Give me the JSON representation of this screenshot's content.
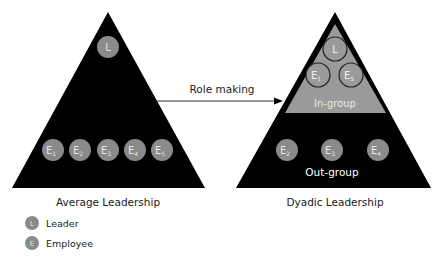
{
  "left_diagram": {
    "caption": "Average Leadership",
    "leader": {
      "label": "L"
    },
    "employees": [
      {
        "letter": "E",
        "sub": "1"
      },
      {
        "letter": "E",
        "sub": "2"
      },
      {
        "letter": "E",
        "sub": "3"
      },
      {
        "letter": "E",
        "sub": "4"
      },
      {
        "letter": "E",
        "sub": "5"
      }
    ]
  },
  "arrow": {
    "label": "Role making"
  },
  "right_diagram": {
    "caption": "Dyadic Leadership",
    "in_group": {
      "label": "In-group",
      "leader": {
        "label": "L"
      },
      "members": [
        {
          "letter": "E",
          "sub": "1"
        },
        {
          "letter": "E",
          "sub": "5"
        }
      ]
    },
    "out_group": {
      "label": "Out-group",
      "members": [
        {
          "letter": "E",
          "sub": "2"
        },
        {
          "letter": "E",
          "sub": "3"
        },
        {
          "letter": "E",
          "sub": "4"
        }
      ]
    }
  },
  "legend": {
    "items": [
      {
        "symbol": "L",
        "label": "Leader"
      },
      {
        "symbol": "E",
        "label": "Employee"
      }
    ]
  },
  "colors": {
    "triangle": "#000000",
    "circle_fill": "#8a8a8a",
    "in_group_fill": "#9a9a9a",
    "circle_text": "#e6e6e6",
    "label_text": "#1a1a1a"
  }
}
